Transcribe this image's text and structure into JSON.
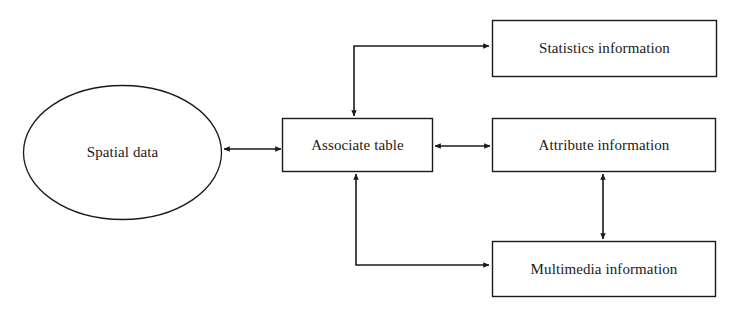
{
  "diagram": {
    "type": "flow-diagram",
    "background_color": "#ffffff",
    "stroke_color": "#1a1a1a",
    "nodes": [
      {
        "id": "spatial-data",
        "label": "Spatial data",
        "shape": "ellipse",
        "cx": 122,
        "cy": 152,
        "rx": 99,
        "ry": 67
      },
      {
        "id": "associate-table",
        "label": "Associate table",
        "shape": "rect",
        "x": 282,
        "y": 118,
        "width": 151,
        "height": 54
      },
      {
        "id": "statistics-information",
        "label": "Statistics information",
        "shape": "rect",
        "x": 492,
        "y": 20,
        "width": 225,
        "height": 57
      },
      {
        "id": "attribute-information",
        "label": "Attribute information",
        "shape": "rect",
        "x": 492,
        "y": 118,
        "width": 224,
        "height": 54
      },
      {
        "id": "multimedia-information",
        "label": "Multimedia information",
        "shape": "rect",
        "x": 492,
        "y": 241,
        "width": 224,
        "height": 56
      }
    ],
    "edges": [
      {
        "id": "spatial-data--associate-table",
        "from": "spatial-data",
        "to": "associate-table",
        "arrow": "double",
        "path": "horizontal"
      },
      {
        "id": "associate-table--statistics-information",
        "from": "associate-table",
        "to": "statistics-information",
        "arrow": "double",
        "path": "elbow-up"
      },
      {
        "id": "associate-table--attribute-information",
        "from": "associate-table",
        "to": "attribute-information",
        "arrow": "double",
        "path": "horizontal"
      },
      {
        "id": "associate-table--multimedia-information",
        "from": "associate-table",
        "to": "multimedia-information",
        "arrow": "double",
        "path": "elbow-down"
      },
      {
        "id": "attribute-information--multimedia-information",
        "from": "attribute-information",
        "to": "multimedia-information",
        "arrow": "double",
        "path": "vertical"
      }
    ]
  }
}
